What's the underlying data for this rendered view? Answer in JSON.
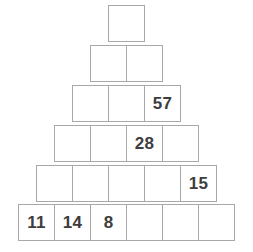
{
  "puzzle": {
    "type": "number-pyramid",
    "rows": [
      {
        "index": 1,
        "cells": [
          ""
        ]
      },
      {
        "index": 2,
        "cells": [
          "",
          ""
        ]
      },
      {
        "index": 3,
        "cells": [
          "",
          "",
          "57"
        ]
      },
      {
        "index": 4,
        "cells": [
          "",
          "",
          "28",
          ""
        ]
      },
      {
        "index": 5,
        "cells": [
          "",
          "",
          "",
          "",
          "15"
        ]
      },
      {
        "index": 6,
        "cells": [
          "11",
          "14",
          "8",
          "",
          "",
          ""
        ]
      }
    ],
    "colors": {
      "border": "#a8a8a8",
      "text": "#3d3d3d",
      "background": "#ffffff"
    }
  }
}
